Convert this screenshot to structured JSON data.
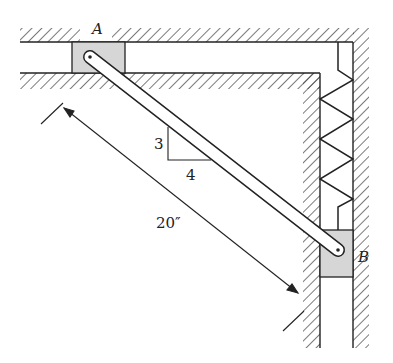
{
  "diagram": {
    "labels": {
      "point_a": "A",
      "point_b": "B",
      "slope_rise": "3",
      "slope_run": "4",
      "length": "20″"
    },
    "colors": {
      "line": "#222222",
      "slider_fill": "#d6d6d6",
      "bar_fill": "#ffffff",
      "background": "#ffffff"
    },
    "components": {
      "bar": "rigid bar AB",
      "slider_a": "slider in horizontal guide",
      "slider_b": "slider in vertical guide",
      "spring": "compression spring above slider B"
    }
  }
}
